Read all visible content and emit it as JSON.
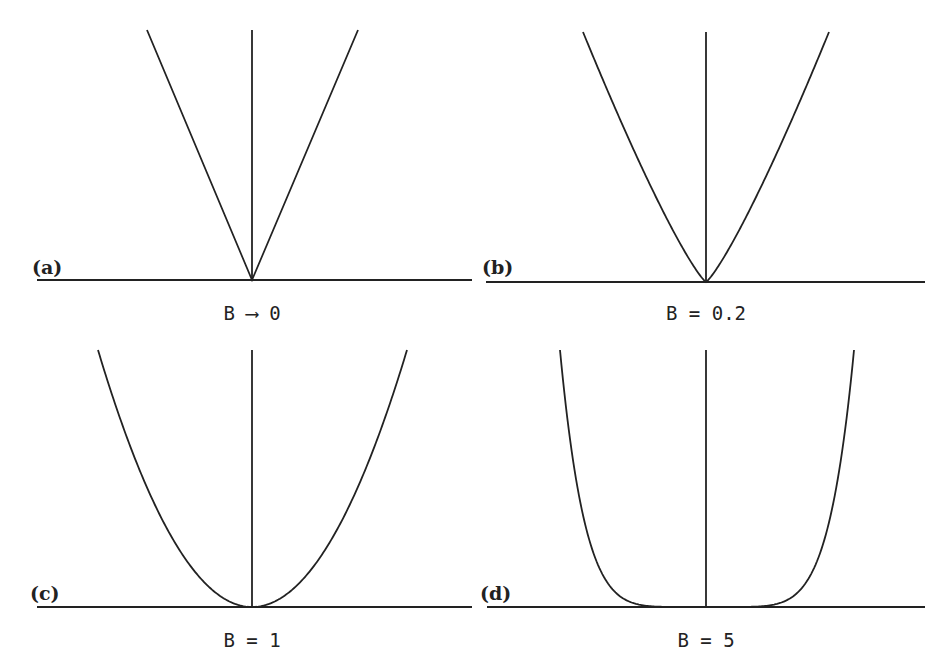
{
  "figure": {
    "panels": [
      {
        "id": "a",
        "tag": "(a)",
        "caption": "B ⟶ 0",
        "B": 0.0,
        "exponent": 1.0
      },
      {
        "id": "b",
        "tag": "(b)",
        "caption": "B = 0.2",
        "B": 0.2,
        "exponent": 1.2
      },
      {
        "id": "c",
        "tag": "(c)",
        "caption": "B = 1",
        "B": 1,
        "exponent": 2.0
      },
      {
        "id": "d",
        "tag": "(d)",
        "caption": "B = 5",
        "B": 5,
        "exponent": 6.0
      }
    ]
  },
  "chart_data": [
    {
      "type": "line",
      "title": "(a)",
      "xlabel": "B → 0",
      "description": "V-shaped curve y = |x|^(1+B) with B → 0, vertical axis at center",
      "series": [
        {
          "name": "y=|x|^1",
          "exponent": 1.0
        }
      ],
      "grid": false
    },
    {
      "type": "line",
      "title": "(b)",
      "xlabel": "B = 0.2",
      "description": "curve y = |x|^(1+B), B = 0.2",
      "series": [
        {
          "name": "y=|x|^1.2",
          "exponent": 1.2
        }
      ],
      "grid": false
    },
    {
      "type": "line",
      "title": "(c)",
      "xlabel": "B = 1",
      "description": "parabola y = |x|^(1+B), B = 1",
      "series": [
        {
          "name": "y=|x|^2",
          "exponent": 2.0
        }
      ],
      "grid": false
    },
    {
      "type": "line",
      "title": "(d)",
      "xlabel": "B = 5",
      "description": "flat-bottomed curve y = |x|^(1+B), B = 5",
      "series": [
        {
          "name": "y=|x|^6",
          "exponent": 6.0
        }
      ],
      "grid": false
    }
  ]
}
